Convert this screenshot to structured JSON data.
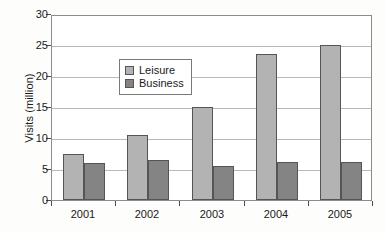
{
  "chart_data": {
    "type": "bar",
    "title": "",
    "subtitle": "",
    "xlabel": "",
    "ylabel": "Visits (million)",
    "categories": [
      "2001",
      "2002",
      "2003",
      "2004",
      "2005"
    ],
    "series": [
      {
        "name": "Leisure",
        "color": "#b3b3b3",
        "values": [
          7.4,
          10.5,
          15.0,
          23.5,
          25.0
        ]
      },
      {
        "name": "Business",
        "color": "#848484",
        "values": [
          6.0,
          6.5,
          5.5,
          6.1,
          6.1
        ]
      }
    ],
    "ylim": [
      0,
      30
    ],
    "yticks": [
      0,
      5,
      10,
      15,
      20,
      25,
      30
    ],
    "ytick_labels": [
      "0",
      "5",
      "10",
      "15",
      "20",
      "25",
      "30"
    ],
    "grid": true,
    "grid_axis": "y",
    "legend_position": "upper-left-inside",
    "bar_group_layout": "adjacent-pairs",
    "frame": true,
    "background": "#ffffff"
  },
  "legend": {
    "entries": [
      {
        "label": "Leisure"
      },
      {
        "label": "Business"
      }
    ]
  }
}
